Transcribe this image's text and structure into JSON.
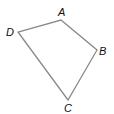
{
  "diagram": {
    "type": "quadrilateral",
    "stroke_color": "#8a8a8a",
    "label_color": "#111111",
    "vertices": [
      {
        "name": "A",
        "x": 61,
        "y": 20,
        "label": "A",
        "label_x": 58,
        "label_y": 16
      },
      {
        "name": "B",
        "x": 97,
        "y": 50,
        "label": "B",
        "label_x": 99,
        "label_y": 55
      },
      {
        "name": "C",
        "x": 68,
        "y": 100,
        "label": "C",
        "label_x": 64,
        "label_y": 112
      },
      {
        "name": "D",
        "x": 18,
        "y": 32,
        "label": "D",
        "label_x": 6,
        "label_y": 36
      }
    ],
    "edges": [
      [
        "A",
        "B"
      ],
      [
        "B",
        "C"
      ],
      [
        "C",
        "D"
      ],
      [
        "D",
        "A"
      ]
    ]
  }
}
